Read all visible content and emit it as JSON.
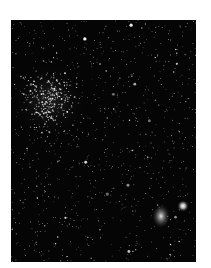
{
  "image": {
    "caption": "Astronomical starfield photograph (no visible text or labels)",
    "background_color": "#ffffff",
    "field_color": "#050505",
    "bounds": {
      "left": 11,
      "top": 20,
      "width": 185,
      "height": 242
    },
    "note": "Feature positions are approximate visual estimates, not measured coordinates; field stars are procedurally generated to mimic texture."
  },
  "features": {
    "cluster": {
      "label": "dense star cluster (upper left)",
      "cx": 38,
      "cy": 80,
      "radius": 30,
      "count": 260
    },
    "nebula": {
      "label": "diffuse bright object (lower right)",
      "cx": 150,
      "cy": 195,
      "rx": 9,
      "ry": 12
    },
    "bright_star": {
      "label": "bright star beside diffuse object",
      "cx": 172,
      "cy": 186,
      "r": 3.2
    }
  },
  "field": {
    "star_count": 900,
    "seed": 7
  }
}
